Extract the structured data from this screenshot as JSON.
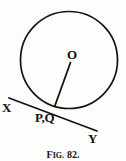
{
  "figure": {
    "caption_prefix": "F",
    "caption_prefix_small": "IG.",
    "caption_number": "82.",
    "caption_full": "FIG. 82.",
    "stroke_color": "#16130f",
    "background_color": "#fdfdfc"
  },
  "labels": {
    "center": "O",
    "tangent_left_end": "X",
    "tangent_right_end": "Y",
    "tangent_point": "P,Q"
  },
  "geometry": {
    "circle": {
      "center_x": 69,
      "center_y": 60,
      "radius": 48.5
    },
    "radius_line": {
      "x1": 70.5,
      "y1": 62.5,
      "x2": 55,
      "y2": 105.5
    },
    "tangent_line": {
      "x1": 9,
      "y1": 98,
      "x2": 97,
      "y2": 131
    }
  }
}
